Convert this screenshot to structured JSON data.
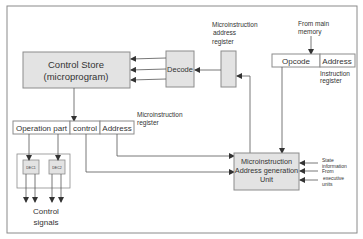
{
  "colors": {
    "frame": "#8a8a8a",
    "box_fill": "#e3e3e3",
    "box_stroke": "#8c8c8c",
    "line": "#555555",
    "text": "#333333"
  },
  "control_store": {
    "line1": "Control Store",
    "line2": "(microprogram)"
  },
  "decode": {
    "label": "Decode"
  },
  "mar_label": {
    "line1": "Microinstruction",
    "line2": "address",
    "line3": "register"
  },
  "from_memory": {
    "line1": "From main",
    "line2": "memory"
  },
  "instruction_register": {
    "fields": [
      "Opcode",
      "Address"
    ],
    "label1": "Instruction",
    "label2": "register"
  },
  "microinstruction_register": {
    "fields": [
      "Operation part",
      "control",
      "Address"
    ],
    "label1": "Microinstruction",
    "label2": "register"
  },
  "decoders": [
    "DEC1",
    "DEC2"
  ],
  "control_signals": {
    "line1": "Control",
    "line2": "signals"
  },
  "address_gen_unit": {
    "line1": "Microinstruction",
    "line2": "Address generation",
    "line3": "Unit"
  },
  "side_inputs": {
    "line1": "State",
    "line2": "information",
    "line3": "From",
    "line4": "executive",
    "line5": "units"
  }
}
